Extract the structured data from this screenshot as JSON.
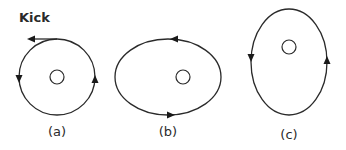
{
  "diagram": {
    "kick_label": "Kick",
    "panels": [
      {
        "id": "a",
        "caption": "(a)",
        "shape": "circle",
        "direction": "counterclockwise"
      },
      {
        "id": "b",
        "caption": "(b)",
        "shape": "horizontal-ellipse",
        "direction": "counterclockwise"
      },
      {
        "id": "c",
        "caption": "(c)",
        "shape": "vertical-ellipse",
        "direction": "counterclockwise"
      }
    ],
    "colors": {
      "stroke": "#2a2a2a",
      "background": "#ffffff"
    }
  }
}
